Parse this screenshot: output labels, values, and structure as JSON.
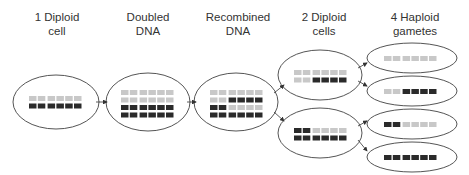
{
  "stages": [
    {
      "line1": "1 Diploid",
      "line2": "cell"
    },
    {
      "line1": "Doubled",
      "line2": "DNA"
    },
    {
      "line1": "Recombined",
      "line2": "DNA"
    },
    {
      "line1": "2 Diploid",
      "line2": "cells"
    },
    {
      "line1": "4 Haploid",
      "line2": "gametes"
    }
  ],
  "colors": {
    "light_block": "#c8c8c8",
    "dark_block": "#2a2a2a",
    "outline": "#555555",
    "arrow": "#333333"
  },
  "cells": {
    "diploid_cell": [
      "LLLLLL",
      "DDDDDD"
    ],
    "doubled_dna": [
      "LLLLLL",
      "LLLLLL",
      "DDDDDD",
      "DDDDDD"
    ],
    "recombined_dna": [
      "LLLLLL",
      "LLDDDD",
      "DDLLLL",
      "DDDDDD"
    ],
    "diploid_cell_top": [
      "LLLLLL",
      "LLDDDD"
    ],
    "diploid_cell_bottom": [
      "DDLLLL",
      "DDDDDD"
    ],
    "gamete_1": [
      "LLLLLL"
    ],
    "gamete_2": [
      "LLDDDD"
    ],
    "gamete_3": [
      "DDLLLL"
    ],
    "gamete_4": [
      "DDDDDD"
    ]
  }
}
